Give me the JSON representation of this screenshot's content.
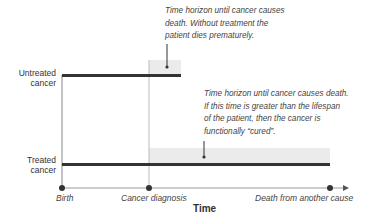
{
  "diagram": {
    "rows": [
      {
        "label_line1": "Untreated",
        "label_line2": "cancer"
      },
      {
        "label_line1": "Treated",
        "label_line2": "cancer"
      }
    ],
    "annotations": [
      {
        "line1": "Time horizon until cancer causes",
        "line2": "death. Without treatment the",
        "line3": "patient dies prematurely."
      },
      {
        "line1": "Time horizon until cancer causes death.",
        "line2": "If this time is greater than the lifespan",
        "line3": "of the patient, then the cancer is",
        "line4": "functionally “cured”."
      }
    ],
    "axis": {
      "title": "Time",
      "ticks": [
        "Birth",
        "Cancer diagnosis",
        "Death from another cause"
      ]
    },
    "colors": {
      "bar": "#333333",
      "shade": "#ebebeb",
      "axis": "#888888"
    }
  }
}
